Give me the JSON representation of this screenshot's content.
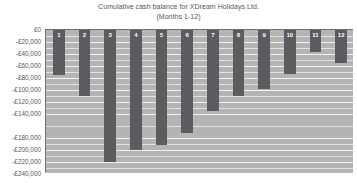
{
  "chart_data": {
    "type": "bar",
    "title": "Cumulative cash balance for XDream Holidays Ltd.",
    "subtitle": "(Months 1-12)",
    "xlabel": "",
    "ylabel": "",
    "categories": [
      "1",
      "2",
      "3",
      "4",
      "5",
      "6",
      "7",
      "8",
      "9",
      "10",
      "11",
      "12"
    ],
    "values": [
      -75000,
      -110000,
      -220000,
      -200000,
      -192000,
      -172000,
      -135000,
      -110000,
      -98000,
      -73000,
      -37000,
      -55000
    ],
    "ylim": [
      -240000,
      0
    ],
    "ytick_values": [
      0,
      -20000,
      -40000,
      -60000,
      -80000,
      -100000,
      -120000,
      -140000,
      -180000,
      -200000,
      -220000,
      -240000
    ],
    "ytick_labels": [
      "£0",
      "-£20,000",
      "-£40,000",
      "-£60,000",
      "-£80,000",
      "-£100,000",
      "-£120,000",
      "-£140,000",
      "-£180,000",
      "-£200,000",
      "-£220,000",
      "-£240,000"
    ],
    "grid": true,
    "legend": false,
    "colors": {
      "bar": "#5b5c60",
      "plot_background": "#b4b4b4",
      "gridline": "#f3f3f3",
      "axis": "#6f7073",
      "text": "#55565a",
      "bar_label": "#ffffff"
    }
  }
}
